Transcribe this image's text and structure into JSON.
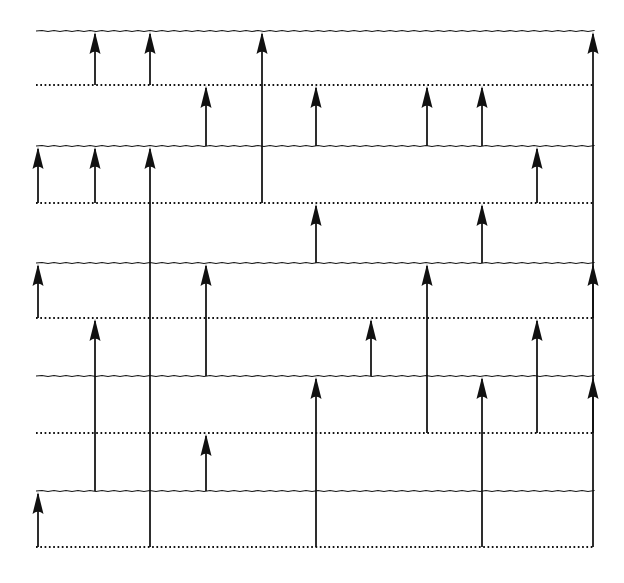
{
  "figure": {
    "title": "",
    "kind": "energy-level-transition-diagram",
    "width": 624,
    "height": 583,
    "background_color": "#ffffff",
    "line_color": "#141414",
    "arrow_color": "#111111"
  },
  "chart_data": {
    "type": "line",
    "title": "",
    "xlabel": "",
    "ylabel": "",
    "grid": false,
    "legend": null,
    "xlim": [
      36,
      594
    ],
    "ylim": [
      20,
      560
    ],
    "levels": [
      {
        "id": "L1",
        "style": "solid",
        "y": 31,
        "x_start": 36,
        "x_end": 594
      },
      {
        "id": "L2",
        "style": "dotted",
        "y": 85,
        "x_start": 36,
        "x_end": 594
      },
      {
        "id": "L3",
        "style": "solid",
        "y": 146,
        "x_start": 36,
        "x_end": 594
      },
      {
        "id": "L4",
        "style": "dotted",
        "y": 203,
        "x_start": 36,
        "x_end": 594
      },
      {
        "id": "L5",
        "style": "solid",
        "y": 263,
        "x_start": 36,
        "x_end": 594
      },
      {
        "id": "L6",
        "style": "dotted",
        "y": 318,
        "x_start": 36,
        "x_end": 594
      },
      {
        "id": "L7",
        "style": "solid",
        "y": 376,
        "x_start": 36,
        "x_end": 594
      },
      {
        "id": "L8",
        "style": "dotted",
        "y": 433,
        "x_start": 36,
        "x_end": 594
      },
      {
        "id": "L9",
        "style": "solid",
        "y": 491,
        "x_start": 36,
        "x_end": 594
      },
      {
        "id": "L10",
        "style": "dotted",
        "y": 547,
        "x_start": 36,
        "x_end": 594
      }
    ],
    "columns": [
      38,
      95,
      150,
      206,
      262,
      316,
      371,
      427,
      482,
      537,
      593
    ],
    "arrows": [
      {
        "x": 95,
        "y_from": 85,
        "y_to": 31
      },
      {
        "x": 150,
        "y_from": 85,
        "y_to": 31
      },
      {
        "x": 262,
        "y_from": 203,
        "y_to": 31
      },
      {
        "x": 593,
        "y_from": 318,
        "y_to": 31
      },
      {
        "x": 206,
        "y_from": 146,
        "y_to": 85
      },
      {
        "x": 316,
        "y_from": 146,
        "y_to": 85
      },
      {
        "x": 427,
        "y_from": 146,
        "y_to": 85
      },
      {
        "x": 482,
        "y_from": 146,
        "y_to": 85
      },
      {
        "x": 38,
        "y_from": 203,
        "y_to": 146
      },
      {
        "x": 95,
        "y_from": 203,
        "y_to": 146
      },
      {
        "x": 150,
        "y_from": 547,
        "y_to": 146
      },
      {
        "x": 537,
        "y_from": 203,
        "y_to": 146
      },
      {
        "x": 316,
        "y_from": 263,
        "y_to": 203
      },
      {
        "x": 482,
        "y_from": 263,
        "y_to": 203
      },
      {
        "x": 38,
        "y_from": 318,
        "y_to": 263
      },
      {
        "x": 206,
        "y_from": 376,
        "y_to": 263
      },
      {
        "x": 427,
        "y_from": 433,
        "y_to": 263
      },
      {
        "x": 593,
        "y_from": 433,
        "y_to": 263
      },
      {
        "x": 95,
        "y_from": 491,
        "y_to": 318
      },
      {
        "x": 371,
        "y_from": 376,
        "y_to": 318
      },
      {
        "x": 537,
        "y_from": 433,
        "y_to": 318
      },
      {
        "x": 316,
        "y_from": 547,
        "y_to": 376
      },
      {
        "x": 482,
        "y_from": 547,
        "y_to": 376
      },
      {
        "x": 593,
        "y_from": 547,
        "y_to": 376
      },
      {
        "x": 206,
        "y_from": 491,
        "y_to": 433
      },
      {
        "x": 38,
        "y_from": 547,
        "y_to": 491
      }
    ]
  }
}
